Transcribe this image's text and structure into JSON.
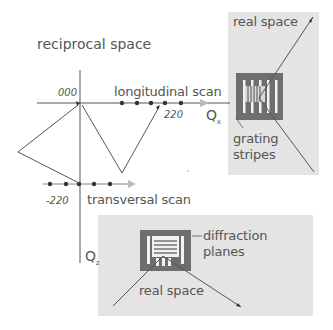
{
  "title": "reciprocal space",
  "axes": {
    "qx_label": "Q",
    "qx_sub": "x",
    "qz_label": "Q",
    "qz_sub": "z"
  },
  "reflections": {
    "origin": "000",
    "longitudinal": "220",
    "transversal": "-220"
  },
  "scans": {
    "longitudinal": "longitudinal scan",
    "transversal": "transversal scan"
  },
  "panel_top": {
    "title": "real space",
    "caption_line1": "grating",
    "caption_line2": "stripes"
  },
  "panel_bottom": {
    "title": "real space",
    "caption_line1": "diffraction",
    "caption_line2": "planes"
  },
  "colors": {
    "panel_bg": "#e4e4e4",
    "grating_frame": "#6e6e6e",
    "line": "#555555",
    "arrow_head": "#bbbbbb",
    "dot": "#333333"
  }
}
